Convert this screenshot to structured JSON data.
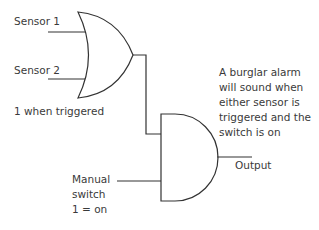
{
  "diagram": {
    "type": "logic-circuit",
    "inputs": {
      "sensor1": "Sensor 1",
      "sensor2": "Sensor 2",
      "sensors_note": "1 when triggered",
      "switch_line1": "Manual",
      "switch_line2": "switch",
      "switch_line3": "1 = on"
    },
    "gates": [
      {
        "id": "or-gate",
        "type": "OR",
        "inputs": [
          "Sensor 1",
          "Sensor 2"
        ]
      },
      {
        "id": "and-gate",
        "type": "AND",
        "inputs": [
          "or-gate",
          "Manual switch"
        ]
      }
    ],
    "output_label": "Output",
    "description": [
      "A burglar alarm",
      "will sound when",
      "either sensor is",
      "triggered and the",
      "switch is on"
    ],
    "colors": {
      "line": "#333333",
      "text": "#3a3a3a",
      "background": "#ffffff"
    }
  }
}
